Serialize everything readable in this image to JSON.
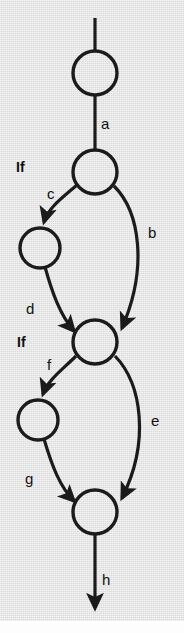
{
  "figure": {
    "kind": "control-flow-graph",
    "background_color": "#e3e3e3",
    "ink_color": "#1b1b1b",
    "width": 184,
    "height": 633
  },
  "nodes": [
    {
      "id": "n1",
      "label": "",
      "cx": 95,
      "cy": 73,
      "r": 22
    },
    {
      "id": "n2",
      "label": "",
      "cx": 95,
      "cy": 172,
      "r": 22
    },
    {
      "id": "n3",
      "label": "",
      "cx": 40,
      "cy": 248,
      "r": 20
    },
    {
      "id": "n4",
      "label": "",
      "cx": 95,
      "cy": 342,
      "r": 22
    },
    {
      "id": "n5",
      "label": "",
      "cx": 38,
      "cy": 420,
      "r": 20
    },
    {
      "id": "n6",
      "label": "",
      "cx": 95,
      "cy": 512,
      "r": 22
    }
  ],
  "edges": [
    {
      "id": "entry",
      "label": "",
      "from": "",
      "to": "n1",
      "arrowhead": false
    },
    {
      "id": "a",
      "label": "a",
      "from": "n1",
      "to": "n2",
      "arrowhead": false,
      "label_x": 101,
      "label_y": 116
    },
    {
      "id": "c",
      "label": "c",
      "from": "n2",
      "to": "n3",
      "arrowhead": true,
      "label_x": 47,
      "label_y": 186
    },
    {
      "id": "b",
      "label": "b",
      "from": "n2",
      "to": "n4",
      "arrowhead": true,
      "label_x": 148,
      "label_y": 225
    },
    {
      "id": "d",
      "label": "d",
      "from": "n3",
      "to": "n4",
      "arrowhead": true,
      "label_x": 26,
      "label_y": 301
    },
    {
      "id": "f",
      "label": "f",
      "from": "n4",
      "to": "n5",
      "arrowhead": true,
      "label_x": 47,
      "label_y": 357
    },
    {
      "id": "e",
      "label": "e",
      "from": "n4",
      "to": "n6",
      "arrowhead": true,
      "label_x": 151,
      "label_y": 413
    },
    {
      "id": "g",
      "label": "g",
      "from": "n5",
      "to": "n6",
      "arrowhead": true,
      "label_x": 25,
      "label_y": 471
    },
    {
      "id": "h",
      "label": "h",
      "from": "n6",
      "to": "",
      "arrowhead": true,
      "label_x": 102,
      "label_y": 572
    }
  ],
  "annotations": [
    {
      "id": "if-1",
      "text": "If",
      "x": 16,
      "y": 160
    },
    {
      "id": "if-2",
      "text": "If",
      "x": 17,
      "y": 335
    }
  ]
}
